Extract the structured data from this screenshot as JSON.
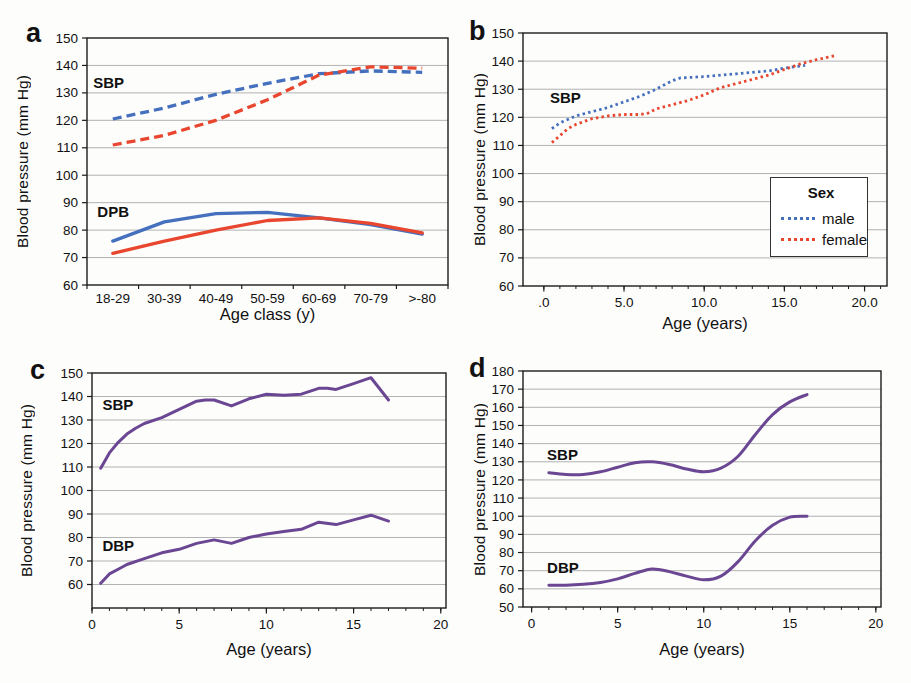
{
  "colors": {
    "male_blue": "#4470bd",
    "female_red": "#e8462e",
    "purple": "#6a4693",
    "grid": "#a9a9a9",
    "axis": "#1c1c1c"
  },
  "chart_data": [
    {
      "panel_label": "a",
      "type": "line",
      "title": "",
      "ylabel": "Blood pressure (mm Hg)",
      "xlabel": "Age class (y)",
      "ylim": [
        60,
        150
      ],
      "yticks": [
        60,
        70,
        80,
        90,
        100,
        110,
        120,
        130,
        140,
        150
      ],
      "grid": true,
      "categories": [
        "18-29",
        "30-39",
        "40-49",
        "50-59",
        "60-69",
        "70-79",
        ">-80"
      ],
      "annotations": [
        {
          "text": "SBP",
          "x": -0.38,
          "y": 133.5
        },
        {
          "text": "DPB",
          "x": -0.3,
          "y": 86.5
        }
      ],
      "series": [
        {
          "name": "SBP male",
          "color": "#4470bd",
          "dash": "dashed",
          "values": [
            120.5,
            124.5,
            129.5,
            133.5,
            137,
            138,
            137.5
          ]
        },
        {
          "name": "SBP female",
          "color": "#e8462e",
          "dash": "dashed",
          "values": [
            111,
            114.5,
            120,
            127.5,
            136.5,
            139.5,
            139
          ]
        },
        {
          "name": "DPB male",
          "color": "#4470bd",
          "dash": "solid",
          "values": [
            76,
            83,
            86,
            86.5,
            84.5,
            82,
            78.5
          ]
        },
        {
          "name": "DPB female",
          "color": "#e8462e",
          "dash": "solid",
          "values": [
            71.5,
            76,
            80,
            83.5,
            84.5,
            82.5,
            79
          ]
        }
      ]
    },
    {
      "panel_label": "b",
      "type": "line",
      "title": "",
      "ylabel": "Blood pressure (mm Hg)",
      "xlabel": "Age (years)",
      "ylim": [
        60,
        150
      ],
      "yticks": [
        60,
        70,
        80,
        90,
        100,
        110,
        120,
        130,
        140,
        150
      ],
      "xlim": [
        -1.3,
        21.4
      ],
      "xticks": [
        {
          "v": 0,
          "label": ".0"
        },
        {
          "v": 5,
          "label": "5.0"
        },
        {
          "v": 10,
          "label": "10.0"
        },
        {
          "v": 15,
          "label": "15.0"
        },
        {
          "v": 20,
          "label": "20.0"
        }
      ],
      "minor_step": 1,
      "grid": true,
      "legend": {
        "title": "Sex",
        "items": [
          {
            "label": "male",
            "color": "#4470bd"
          },
          {
            "label": "female",
            "color": "#e8462e"
          }
        ]
      },
      "annotations": [
        {
          "text": "SBP",
          "x": 0.38,
          "y": 127
        }
      ],
      "series": [
        {
          "name": "male",
          "color": "#4470bd",
          "dash": "dotted",
          "x": [
            0.5,
            1,
            2,
            3,
            4,
            5,
            6,
            7,
            8,
            8.5,
            10,
            12,
            14,
            15,
            16.3
          ],
          "y": [
            116,
            118,
            120.5,
            122,
            123.5,
            125.5,
            127.5,
            130,
            133,
            134,
            134.5,
            135.5,
            136.5,
            137.5,
            138.5
          ]
        },
        {
          "name": "female",
          "color": "#e8462e",
          "dash": "dotted",
          "x": [
            0.5,
            1,
            1.5,
            2,
            3,
            4,
            5,
            6,
            6.5,
            7,
            8,
            9,
            10,
            11,
            12,
            13,
            14,
            15,
            16,
            17,
            18.2
          ],
          "y": [
            111,
            113.5,
            116,
            117.5,
            119.5,
            120.5,
            121,
            121,
            121.5,
            123,
            124.5,
            126,
            128,
            130.5,
            132,
            133.5,
            135,
            137,
            139,
            140.5,
            142
          ]
        }
      ]
    },
    {
      "panel_label": "c",
      "type": "line",
      "title": "",
      "ylabel": "Blood pressure (mm Hg)",
      "xlabel": "Age (years)",
      "ylim": [
        50,
        150
      ],
      "yticks": [
        60,
        70,
        80,
        90,
        100,
        110,
        120,
        130,
        140,
        150
      ],
      "xlim": [
        0,
        20.3
      ],
      "xticks": [
        {
          "v": 0,
          "label": "0"
        },
        {
          "v": 5,
          "label": "5"
        },
        {
          "v": 10,
          "label": "10"
        },
        {
          "v": 15,
          "label": "15"
        },
        {
          "v": 20,
          "label": "20"
        }
      ],
      "minor_step": 1,
      "grid": true,
      "annotations": [
        {
          "text": "SBP",
          "x": 0.6,
          "y": 136.5
        },
        {
          "text": "DBP",
          "x": 0.6,
          "y": 76.5
        }
      ],
      "series": [
        {
          "name": "SBP",
          "color": "#6a4693",
          "dash": "solid",
          "x": [
            0.5,
            1,
            1.5,
            2,
            2.5,
            3,
            4,
            5,
            6,
            6.5,
            7,
            8,
            9,
            10,
            11,
            12,
            13,
            13.5,
            14,
            15,
            16,
            17
          ],
          "y": [
            109.5,
            116,
            120.5,
            124,
            126.5,
            128.5,
            131,
            134.5,
            138,
            138.5,
            138.5,
            136,
            139,
            141,
            140.5,
            141,
            143.5,
            143.5,
            143,
            145.5,
            148,
            138.5
          ]
        },
        {
          "name": "DBP",
          "color": "#6a4693",
          "dash": "solid",
          "x": [
            0.5,
            1,
            1.5,
            2,
            3,
            4,
            5,
            6,
            7,
            8,
            9,
            10,
            11,
            12,
            13,
            14,
            15,
            16,
            17
          ],
          "y": [
            60.5,
            64.5,
            66.5,
            68.5,
            71,
            73.5,
            75,
            77.5,
            79,
            77.5,
            80,
            81.5,
            82.5,
            83.5,
            86.5,
            85.5,
            87.5,
            89.5,
            87
          ]
        }
      ]
    },
    {
      "panel_label": "d",
      "type": "line",
      "title": "",
      "ylabel": "Blood pressure (mm Hg)",
      "xlabel": "Age (years)",
      "ylim": [
        50,
        180
      ],
      "yticks": [
        50,
        60,
        70,
        80,
        90,
        100,
        110,
        120,
        130,
        140,
        150,
        160,
        170,
        180
      ],
      "xlim": [
        -0.5,
        20.3
      ],
      "xticks": [
        {
          "v": 0,
          "label": "0"
        },
        {
          "v": 5,
          "label": "5"
        },
        {
          "v": 10,
          "label": "10"
        },
        {
          "v": 15,
          "label": "15"
        },
        {
          "v": 20,
          "label": "20"
        }
      ],
      "minor_step": 1,
      "grid": true,
      "smooth": true,
      "annotations": [
        {
          "text": "SBP",
          "x": 0.9,
          "y": 134
        },
        {
          "text": "DBP",
          "x": 0.9,
          "y": 71.5
        }
      ],
      "series": [
        {
          "name": "SBP",
          "color": "#6a4693",
          "dash": "solid",
          "x": [
            1,
            2,
            3,
            4,
            5,
            6,
            7,
            8,
            9,
            10,
            11,
            12,
            13,
            14,
            15,
            16
          ],
          "y": [
            124,
            123,
            123,
            124.5,
            127,
            129.5,
            130,
            128.5,
            126,
            124.5,
            126.5,
            133,
            145,
            156,
            163,
            167
          ]
        },
        {
          "name": "DBP",
          "color": "#6a4693",
          "dash": "solid",
          "x": [
            1,
            2,
            3,
            4,
            5,
            6,
            7,
            8,
            9,
            10,
            11,
            12,
            13,
            14,
            15,
            16
          ],
          "y": [
            62,
            62,
            62.5,
            63.5,
            65.5,
            68.5,
            71,
            69.5,
            67,
            65,
            67,
            75,
            86.5,
            95,
            99.5,
            100
          ]
        }
      ]
    }
  ]
}
